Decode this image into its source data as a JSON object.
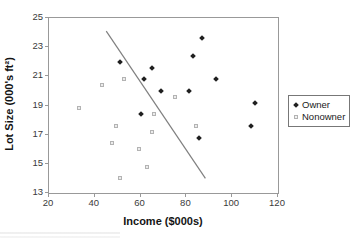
{
  "chart_data": {
    "type": "scatter",
    "title": "",
    "xlabel": "Income ($000s)",
    "ylabel": "Lot Size (000's ft²)",
    "xlim": [
      20,
      120
    ],
    "ylim": [
      13,
      25
    ],
    "x_ticks": [
      20,
      40,
      60,
      80,
      100,
      120
    ],
    "y_ticks": [
      25,
      23,
      21,
      19,
      17,
      15,
      13
    ],
    "grid": false,
    "legend_position": "right-outside",
    "series": [
      {
        "name": "Owner",
        "marker": "filled-diamond",
        "color": "#1f1f1f",
        "points": [
          [
            60.0,
            18.4
          ],
          [
            85.5,
            16.8
          ],
          [
            64.8,
            21.6
          ],
          [
            61.5,
            20.8
          ],
          [
            87.0,
            23.6
          ],
          [
            110.1,
            19.2
          ],
          [
            108.0,
            17.6
          ],
          [
            82.8,
            22.4
          ],
          [
            69.0,
            20.0
          ],
          [
            93.0,
            20.8
          ],
          [
            51.0,
            22.0
          ],
          [
            81.0,
            20.0
          ]
        ]
      },
      {
        "name": "Nonowner",
        "marker": "open-square",
        "color": "#b3b3b3",
        "points": [
          [
            75.0,
            19.6
          ],
          [
            52.8,
            20.8
          ],
          [
            64.8,
            17.2
          ],
          [
            43.2,
            20.4
          ],
          [
            84.0,
            17.6
          ],
          [
            49.2,
            17.6
          ],
          [
            59.4,
            16.0
          ],
          [
            66.0,
            18.4
          ],
          [
            47.4,
            16.4
          ],
          [
            33.0,
            18.8
          ],
          [
            51.0,
            14.0
          ],
          [
            63.0,
            14.8
          ]
        ]
      }
    ],
    "separator_line": {
      "x1": 45.0,
      "y1": 24.1,
      "x2": 88.3,
      "y2": 14.0,
      "color": "#808080"
    }
  },
  "colors": {
    "frame": "#999999",
    "tick_label": "#3a3a3a",
    "axis_title": "#141414",
    "background": "#ffffff"
  }
}
